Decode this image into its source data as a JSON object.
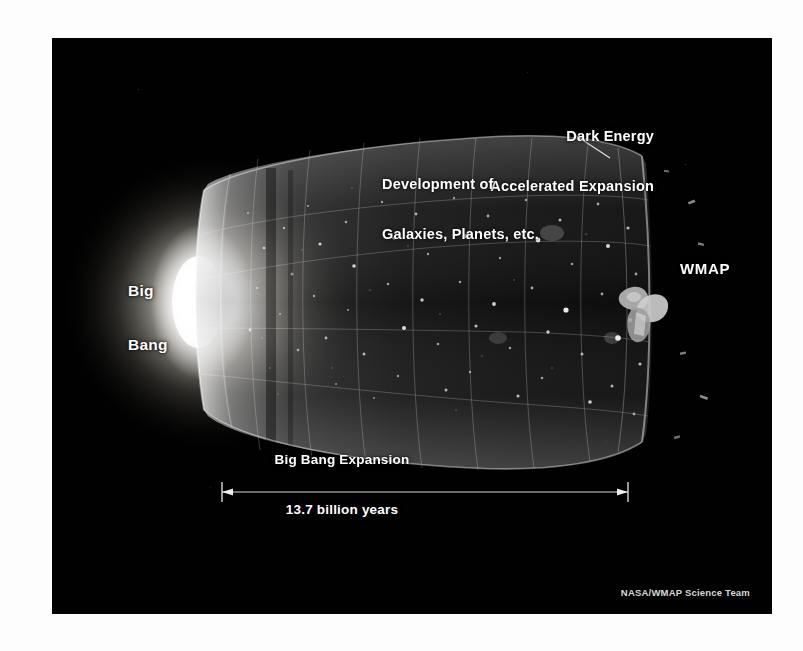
{
  "figure": {
    "panel_background": "#010101",
    "page_background": "#ffffff",
    "text_color": "#ffffff"
  },
  "annotations": {
    "dark_energy": {
      "line1": "Dark Energy",
      "line2": "Accelerated Expansion",
      "leader_line": true
    },
    "development": {
      "line1": "Development of",
      "line2": "Galaxies, Planets, etc."
    },
    "big_bang": {
      "line1": "Big",
      "line2": "Bang"
    },
    "wmap": {
      "label": "WMAP"
    }
  },
  "scale_bar": {
    "caption_above": "Big Bang Expansion",
    "caption_below": "13.7 billion years",
    "value": 13.7,
    "unit": "billion years",
    "arrow_style": "double-headed"
  },
  "credit": {
    "text": "NASA/WMAP Science Team"
  }
}
